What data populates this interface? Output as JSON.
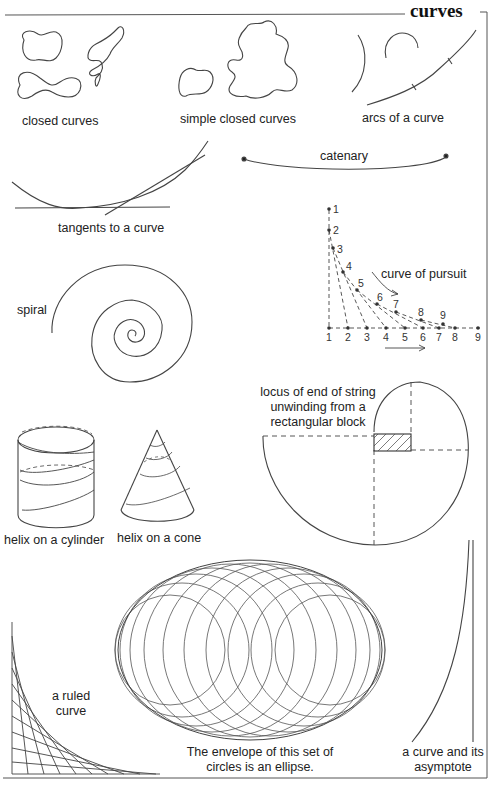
{
  "page": {
    "title": "curves"
  },
  "figures": {
    "closed_curves": {
      "label": "closed curves"
    },
    "simple_closed_curves": {
      "label": "simple closed curves"
    },
    "arcs": {
      "label": "arcs of a curve"
    },
    "catenary": {
      "label": "catenary"
    },
    "tangents": {
      "label": "tangents to a curve"
    },
    "pursuit": {
      "label": "curve of pursuit",
      "pursuer_points": [
        "1",
        "2",
        "3",
        "4",
        "5",
        "6",
        "7",
        "8",
        "9"
      ],
      "target_points": [
        "1",
        "2",
        "3",
        "4",
        "5",
        "6",
        "7",
        "8",
        "9"
      ]
    },
    "spiral": {
      "label": "spiral"
    },
    "locus": {
      "label_line1": "locus of end of string",
      "label_line2": "unwinding from a",
      "label_line3": "rectangular block"
    },
    "helix_cylinder": {
      "label": "helix on a cylinder"
    },
    "helix_cone": {
      "label": "helix on a cone"
    },
    "ruled_curve": {
      "label_line1": "a ruled",
      "label_line2": "curve"
    },
    "envelope": {
      "label_line1": "The envelope of this set of",
      "label_line2": "circles is an ellipse."
    },
    "asymptote": {
      "label_line1": "a curve and its",
      "label_line2": "asymptote"
    }
  },
  "colors": {
    "ink": "#333333",
    "rule": "#555555",
    "background": "#ffffff"
  }
}
